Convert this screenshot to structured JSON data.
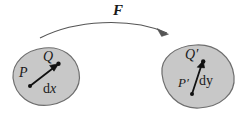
{
  "figure": {
    "width": 245,
    "height": 119,
    "background": "#ffffff",
    "ink_color": "#1a1a1a",
    "blob_fill": "#c8c8c8",
    "blob_stroke": "#6e6e6e",
    "arrow_color": "#555555"
  },
  "labels": {
    "mapping": "F",
    "source_point": "P",
    "source_point_end": "Q",
    "source_vector": {
      "d": "d",
      "var": "x"
    },
    "target_point": "P",
    "target_point_prime": "′",
    "target_point_end": "Q",
    "target_point_end_prime": "′",
    "target_vector": {
      "d": "d",
      "var": "y"
    }
  },
  "shapes": {
    "source_blob": {
      "name": "source-domain-blob",
      "path": "M 13 78 C 12 63 25 50 44 48 C 62 46 76 56 79 72 C 82 88 70 102 50 105 C 30 108 15 95 13 78 Z",
      "fill": "#c8c8c8",
      "stroke": "#6e6e6e"
    },
    "target_blob": {
      "name": "target-domain-blob",
      "path": "M 162 74 C 160 58 175 46 196 45 C 216 44 232 57 234 76 C 236 94 220 107 199 108 C 178 109 164 93 162 74 Z",
      "fill": "#c8c8c8",
      "stroke": "#6e6e6e"
    },
    "mapping_arrow": {
      "name": "mapping-arrow",
      "path": "M 40 38 C 75 20 130 17 167 33",
      "stroke": "#555555",
      "head_path": "M 167 33 L 158 29 L 163 36 Z"
    },
    "dx_vector": {
      "name": "dx-vector",
      "from": [
        30,
        86
      ],
      "to": [
        58,
        64
      ],
      "stroke": "#111111",
      "head_path": "M 58 64 L 49 65 L 54 71 Z",
      "dot_radius": 2.0
    },
    "dy_vector": {
      "name": "dy-vector",
      "from": [
        192,
        94
      ],
      "to": [
        203,
        61
      ],
      "stroke": "#111111",
      "head_path": "M 203 61 L 197 67 L 204 68 Z",
      "dot_radius": 2.0
    }
  }
}
